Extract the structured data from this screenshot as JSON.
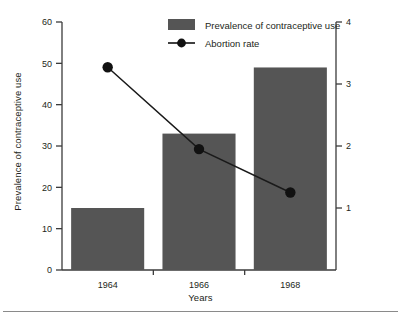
{
  "chart_data": {
    "type": "bar",
    "title": "",
    "subtitle": "",
    "xlabel": "Years",
    "ylabel": "Prevalence of contraceptive use",
    "y2label": "Abortion rate x 100 women 15—44 years old",
    "categories": [
      "1964",
      "1966",
      "1968"
    ],
    "ylim": [
      0,
      60
    ],
    "y2lim": [
      0,
      4
    ],
    "yticks": [
      "0",
      "10",
      "20",
      "30",
      "40",
      "50",
      "60"
    ],
    "ytick_values": [
      0,
      10,
      20,
      30,
      40,
      50,
      60
    ],
    "y2ticks": [
      "1",
      "2",
      "3",
      "4"
    ],
    "y2tick_values": [
      1,
      2,
      3,
      4
    ],
    "grid": false,
    "legend_position": "top-center",
    "series": [
      {
        "name": "Prevalence of contraceptive use",
        "type": "bar",
        "axis": "left",
        "color": "#555555",
        "values": [
          15,
          33,
          49
        ]
      },
      {
        "name": "Abortion rate",
        "type": "line",
        "axis": "right",
        "color": "#111111",
        "marker": "circle",
        "values": [
          3.27,
          1.95,
          1.25
        ]
      }
    ]
  },
  "legend": {
    "items": [
      {
        "label": "Prevalence of contraceptive use",
        "swatch": "bar-swatch",
        "color": "#555555"
      },
      {
        "label": "Abortion rate",
        "swatch": "line-marker-swatch",
        "color": "#111111"
      }
    ]
  },
  "colors": {
    "bar": "#555555",
    "line": "#111111",
    "axis": "#3b3b3b",
    "text": "#231f20",
    "rule": "#8a8a8a",
    "background": "#ffffff"
  }
}
